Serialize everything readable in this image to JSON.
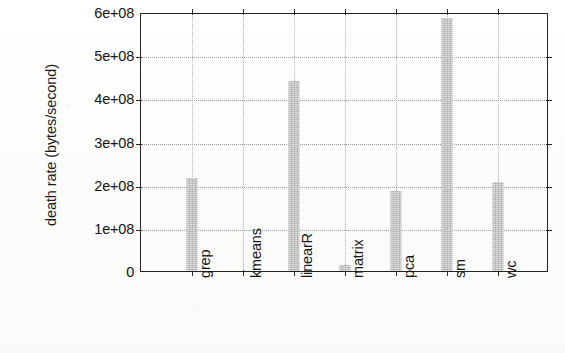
{
  "chart_data": {
    "type": "bar",
    "title": "",
    "subtitle": "",
    "xlabel": "",
    "ylabel": "death rate (bytes/second)",
    "categories": [
      "grep",
      "kmeans",
      "linearR",
      "matrix",
      "pca",
      "sm",
      "wc"
    ],
    "values": [
      215000000,
      0,
      440000000,
      13000000,
      185000000,
      587000000,
      207000000
    ],
    "ylim": [
      0,
      600000000
    ],
    "ytick_values": [
      0,
      100000000,
      200000000,
      300000000,
      400000000,
      500000000,
      600000000
    ],
    "ytick_labels": [
      "0",
      "1e+08",
      "2e+08",
      "3e+08",
      "4e+08",
      "5e+08",
      "6e+08"
    ],
    "grid": true,
    "grid_style": "dotted",
    "legend": null,
    "legend_position": "none",
    "bar_color": "#bdbdbd",
    "axis_color": "#222222",
    "background_color": "#fdfdfc",
    "annotations": []
  }
}
